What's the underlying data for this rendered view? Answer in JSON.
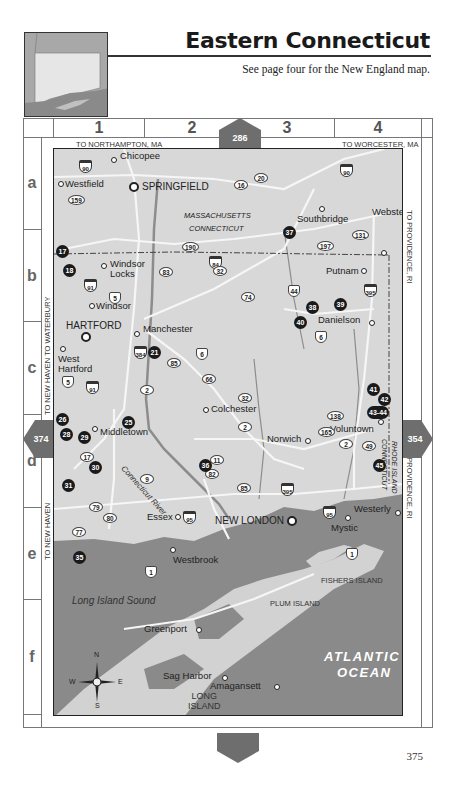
{
  "header": {
    "title": "Eastern Connecticut",
    "subtitle": "See page four for the New England map."
  },
  "grid": {
    "columns": [
      "1",
      "2",
      "3",
      "4"
    ],
    "rows": [
      "a",
      "b",
      "c",
      "d",
      "e",
      "f"
    ]
  },
  "edges": {
    "top_left": "TO NORTHAMPTON, MA",
    "top_right": "TO WORCESTER, MA",
    "left_upper": "TO NEW HAVEN  TO WATERBURY",
    "left_middle": "TO NEW HAVEN",
    "left_lower": "TO NEW HAVEN",
    "right_upper": "TO PROVIDENCE, RI",
    "right_lower": "TO PROVIDENCE, RI"
  },
  "page_links": {
    "top": "286",
    "left": "374",
    "right": "354",
    "bottom": ""
  },
  "map": {
    "towns": [
      {
        "name": "Chicopee",
        "major": false
      },
      {
        "name": "Westfield",
        "major": false
      },
      {
        "name": "SPRINGFIELD",
        "major": true
      },
      {
        "name": "Southbridge",
        "major": false
      },
      {
        "name": "Webster",
        "major": false
      },
      {
        "name": "Windsor Locks",
        "major": false
      },
      {
        "name": "Putnam",
        "major": false
      },
      {
        "name": "Windsor",
        "major": false
      },
      {
        "name": "Danielson",
        "major": false
      },
      {
        "name": "HARTFORD",
        "major": true
      },
      {
        "name": "Manchester",
        "major": false
      },
      {
        "name": "West Hartford",
        "major": false
      },
      {
        "name": "Colchester",
        "major": false
      },
      {
        "name": "Voluntown",
        "major": false
      },
      {
        "name": "Middletown",
        "major": false
      },
      {
        "name": "Norwich",
        "major": false
      },
      {
        "name": "Essex",
        "major": false
      },
      {
        "name": "NEW LONDON",
        "major": true
      },
      {
        "name": "Westerly",
        "major": false
      },
      {
        "name": "Mystic",
        "major": false
      },
      {
        "name": "Westbrook",
        "major": false
      },
      {
        "name": "Greenport",
        "major": false
      },
      {
        "name": "Sag Harbor",
        "major": false
      },
      {
        "name": "Amagansett",
        "major": false
      }
    ],
    "state_labels": {
      "ma": "MASSACHUSETTS",
      "ct": "CONNECTICUT",
      "ri": "RHODE ISLAND",
      "ct_vertical": "CONNECTICUT"
    },
    "water_labels": {
      "sound": "Long Island Sound",
      "ocean_line1": "ATLANTIC",
      "ocean_line2": "OCEAN",
      "river": "Connecticut River"
    },
    "island_labels": {
      "fishers": "FISHERS ISLAND",
      "plum": "PLUM ISLAND",
      "long_line1": "LONG",
      "long_line2": "ISLAND"
    },
    "interstates": [
      "90",
      "91",
      "84",
      "384",
      "395",
      "95"
    ],
    "us_routes": [
      "5",
      "6",
      "44",
      "1"
    ],
    "state_routes": [
      "159",
      "20",
      "16",
      "190",
      "197",
      "131",
      "83",
      "32",
      "74",
      "85",
      "66",
      "2",
      "138",
      "165",
      "49",
      "17",
      "11",
      "82",
      "9",
      "79",
      "80",
      "77"
    ],
    "points_of_interest": [
      "17",
      "18",
      "21",
      "25",
      "26",
      "28",
      "29",
      "30",
      "31",
      "35",
      "36",
      "37",
      "38",
      "39",
      "40",
      "41",
      "42",
      "43-44",
      "45"
    ],
    "compass": {
      "n": "N",
      "s": "S",
      "e": "E",
      "w": "W"
    }
  },
  "colors": {
    "land": "#d8d8d8",
    "water": "#8a8a8a",
    "roads": "#f4f4f4",
    "rivers": "#8c8c8c",
    "poi": "#1a1a1a",
    "arrow": "#6e6e6e"
  },
  "footer": {
    "page_number": "375"
  }
}
